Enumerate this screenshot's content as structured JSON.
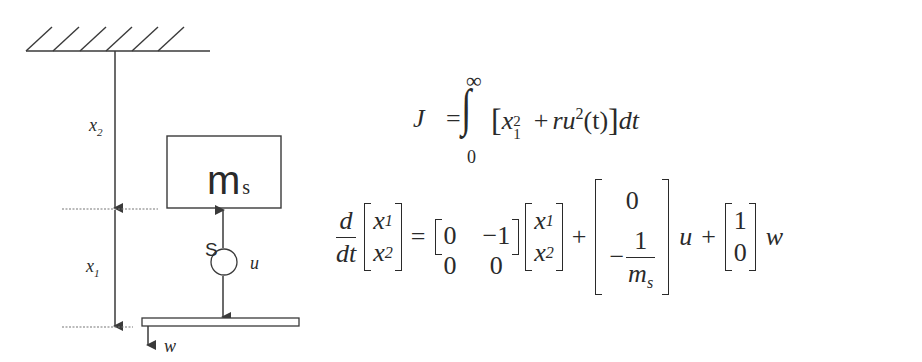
{
  "diagram": {
    "colors": {
      "stroke": "#3a3a3a",
      "dotted": "#777777"
    },
    "labels": {
      "x2": {
        "var": "x",
        "sub": "2"
      },
      "x1": {
        "var": "x",
        "sub": "1"
      },
      "mass": {
        "main": "m",
        "sub": "s"
      },
      "actuator_label": "S",
      "control_input": "u",
      "disturbance": "w"
    }
  },
  "equations": {
    "cost": {
      "lhs": "J",
      "equals": "=",
      "integral": "∫",
      "upper_limit": "∞",
      "lower_limit": "0",
      "open_bracket": "[",
      "term1_var": "x",
      "term1_sub": "1",
      "term1_sup": "2",
      "plus": "+",
      "term2_coef": "ru",
      "term2_sup": "2",
      "term2_arg": "(t)",
      "close_bracket": "]",
      "differential": "dt"
    },
    "state_space": {
      "deriv_num": "d",
      "deriv_den": "dt",
      "state_vec": [
        {
          "var": "x",
          "sub": "1"
        },
        {
          "var": "x",
          "sub": "2"
        }
      ],
      "equals": "=",
      "A_matrix": [
        [
          "0",
          "−1"
        ],
        [
          "0",
          "0"
        ]
      ],
      "state_vec_rhs": [
        {
          "var": "x",
          "sub": "1"
        },
        {
          "var": "x",
          "sub": "2"
        }
      ],
      "plus1": "+",
      "B_vector": {
        "top": "0",
        "bottom_sign": "−",
        "bottom_num": "1",
        "bottom_den_var": "m",
        "bottom_den_sub": "s"
      },
      "u": "u",
      "plus2": "+",
      "E_vector": [
        "1",
        "0"
      ],
      "w": "w"
    }
  }
}
